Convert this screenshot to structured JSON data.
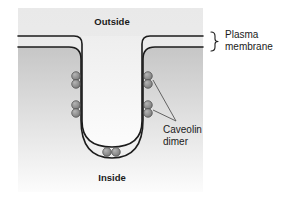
{
  "figure": {
    "title_hidden": "",
    "labels": {
      "outside": "Outside",
      "inside": "Inside",
      "plasma_membrane_line1": "Plasma",
      "plasma_membrane_line2": "membrane",
      "caveolin_line1": "Caveolin",
      "caveolin_line2": "dimer"
    },
    "colors": {
      "panel_top": "#c9c9c9",
      "panel_bottom": "#fbfbfb",
      "cytosol_top": "#cccccc",
      "cytosol_bottom": "#fdfdfd",
      "membrane_stroke": "#1c1c1c",
      "dimer_fill": "#8c8c8c",
      "dimer_stroke": "#3c3c3c",
      "leader_stroke": "#555555",
      "text": "#1a1a1a",
      "background": "#ffffff"
    },
    "counts": {
      "dimers_left": 2,
      "dimers_right": 2,
      "dimers_bottom": 1,
      "membrane_leaflets": 2
    }
  }
}
